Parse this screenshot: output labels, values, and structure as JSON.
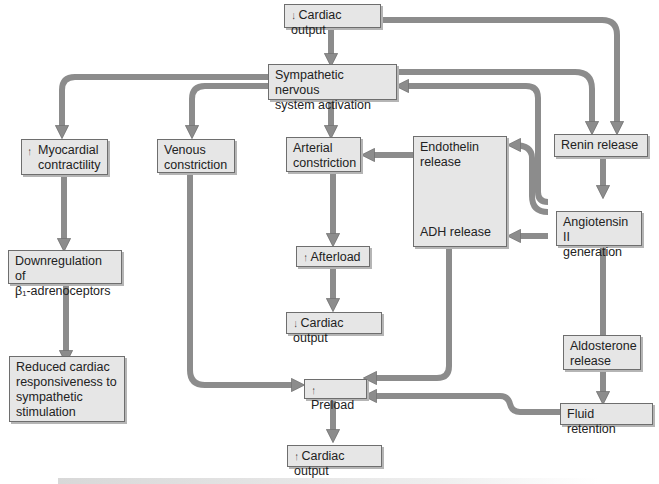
{
  "diagram": {
    "type": "flowchart",
    "colors": {
      "box_fill": "#e6e6e6",
      "box_border": "#6e6e6e",
      "arrow": "#8c8c8c",
      "arrow_edge": "#707070"
    },
    "nodes": {
      "cardiac_output_down": {
        "arrow": "↓",
        "label": "Cardiac output"
      },
      "sns_activation": {
        "label": "Sympathetic nervous\nsystem activation"
      },
      "myocardial_contractility": {
        "arrow": "↑",
        "label": "Myocardial\ncontractility"
      },
      "venous_constriction": {
        "label": "Venous\nconstriction"
      },
      "arterial_constriction": {
        "label": "Arterial\nconstriction"
      },
      "endothelin_adh": {
        "label_top": "Endothelin\nrelease",
        "label_bottom": "ADH release"
      },
      "renin_release": {
        "label": "Renin release"
      },
      "angiotensin_ii": {
        "label": "Angiotensin II\ngeneration"
      },
      "downregulation": {
        "label": "Downregulation of\nβ₁-adrenoceptors"
      },
      "afterload_up": {
        "arrow": "↑",
        "label": "Afterload"
      },
      "cardiac_output_down_2": {
        "arrow": "↓",
        "label": "Cardiac output"
      },
      "reduced_responsiveness": {
        "label": "Reduced cardiac\nresponsiveness to\nsympathetic\nstimulation"
      },
      "aldosterone_release": {
        "label": "Aldosterone\nrelease"
      },
      "preload_up": {
        "arrow": "↑",
        "label": "Preload"
      },
      "fluid_retention": {
        "label": "Fluid retention"
      },
      "cardiac_output_up": {
        "arrow": "↑",
        "label": "Cardiac output"
      }
    },
    "edges": [
      [
        "cardiac_output_down",
        "sns_activation"
      ],
      [
        "cardiac_output_down",
        "renin_release"
      ],
      [
        "sns_activation",
        "myocardial_contractility"
      ],
      [
        "sns_activation",
        "venous_constriction"
      ],
      [
        "sns_activation",
        "arterial_constriction"
      ],
      [
        "sns_activation",
        "renin_release"
      ],
      [
        "angiotensin_ii",
        "sns_activation"
      ],
      [
        "endothelin_adh",
        "arterial_constriction"
      ],
      [
        "angiotensin_ii",
        "endothelin_adh"
      ],
      [
        "angiotensin_ii",
        "endothelin_adh"
      ],
      [
        "renin_release",
        "angiotensin_ii"
      ],
      [
        "angiotensin_ii",
        "aldosterone_release"
      ],
      [
        "myocardial_contractility",
        "downregulation"
      ],
      [
        "downregulation",
        "reduced_responsiveness"
      ],
      [
        "arterial_constriction",
        "afterload_up"
      ],
      [
        "afterload_up",
        "cardiac_output_down_2"
      ],
      [
        "venous_constriction",
        "preload_up"
      ],
      [
        "endothelin_adh",
        "preload_up"
      ],
      [
        "aldosterone_release",
        "fluid_retention"
      ],
      [
        "fluid_retention",
        "preload_up"
      ],
      [
        "preload_up",
        "cardiac_output_up"
      ]
    ]
  }
}
